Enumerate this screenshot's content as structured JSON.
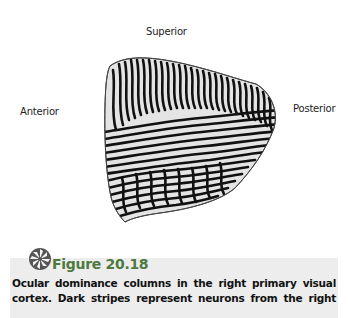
{
  "figure": {
    "orientation_labels": {
      "superior": "Superior",
      "anterior": "Anterior",
      "posterior": "Posterior",
      "inferior": "Inferior"
    },
    "title": "Figure 20.18",
    "caption_lines": [
      "Ocular dominance columns in the right primary visual",
      "cortex. Dark stripes represent neurons from the right"
    ],
    "colors": {
      "title_green": "#4d7a3e",
      "caption_bg": "#ededed",
      "stripe": "#111111",
      "region_fill": "#e4e4e4"
    }
  }
}
